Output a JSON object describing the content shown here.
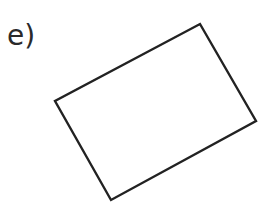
{
  "question": {
    "label": "e)"
  },
  "shape": {
    "type": "rectangle",
    "rotated": true,
    "stroke_color": "#222222",
    "fill_color": "#ffffff",
    "vertices": [
      [
        200,
        24
      ],
      [
        256,
        121
      ],
      [
        111,
        200
      ],
      [
        55,
        101
      ]
    ]
  }
}
